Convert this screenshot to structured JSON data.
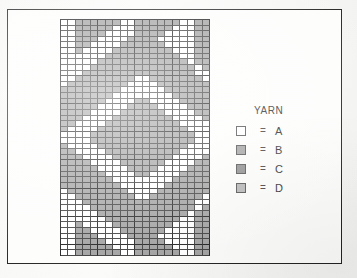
{
  "page": {
    "background_color": "#f7f7f5",
    "frame_color": "#232323"
  },
  "legend": {
    "title": "YARN",
    "entries": [
      {
        "equals": "=",
        "label": "A",
        "color": "#ffffff",
        "swatch_name": "yarn-swatch-a"
      },
      {
        "equals": "=",
        "label": "B",
        "color": "#9f9f9f",
        "swatch_name": "yarn-swatch-b"
      },
      {
        "equals": "=",
        "label": "C",
        "color": "#8a8a8a",
        "swatch_name": "yarn-swatch-c"
      },
      {
        "equals": "=",
        "label": "D",
        "color": "#b4b4b4",
        "swatch_name": "yarn-swatch-d"
      }
    ]
  },
  "chart_data": {
    "type": "heatmap",
    "title": "",
    "xlabel": "",
    "ylabel": "",
    "columns": 20,
    "rows": 42,
    "grid_on": true,
    "legend_position": "right",
    "major_rule_every": 5,
    "palette": {
      "A": "#ffffff",
      "B": "#9f9f9f",
      "C": "#8a8a8a",
      "D": "#b4b4b4"
    },
    "symbols": [
      "A",
      "B",
      "C",
      "D"
    ],
    "cells": [
      "AABBBBBBAABBBBBBAABB",
      "AABBBBBAAABBBBBAAABB",
      "AABBBBAAAABBBBAAAABB",
      "AABBBAAAABBBBAAAAABB",
      "AABBAAAABBBBBBAAAABB",
      "AABAAAABBBBBBBBAAABB",
      "AAAAAABBBBBBBBBBAABB",
      "AAAAABBBBBBBBBBBBABB",
      "AAAABBBBBBBBBBBBBBAB",
      "AAABBBBBBBBBBBBBBBAA",
      "AABBBBBBBBAABBBBBBBA",
      "ABBBBBBBBAAAABBBBBBB",
      "BBBBBBBBAAAAAABBBBBB",
      "BBBBBBBAAAAAAAABBBBB",
      "BBBBBBAAAABBAAAABBBB",
      "BBBBBAAAABBBBAAAABBB",
      "BBBBAAAABBBBBBAAAABB",
      "BBBAAAABBBBBBBBAAAAB",
      "BBAAAABBBBBBBBBBAAAA",
      "BAAAABBBBBBBBBBBBAAA",
      "AAAABBBBBBBBBBBBBBAA",
      "AAAABBBBBBBBBBBBBBAA",
      "BAAAABBBBBBBBBBBBAAA",
      "BBAAAABBBBBBBBBBAAAA",
      "BBBAAAABBBBBBBBAAAAB",
      "BBBBAAAABBBBBBAAAABB",
      "BBBBBAAAABBBBAAAABBB",
      "BBBBBBAAAABBAAAABBBB",
      "BBBBBBBAAAAAAAABBBBB",
      "BBBBBBBBAAAAAABBBBBB",
      "ABBBBBBBBAAAABBBBBBB",
      "AABBBBBBBBAABBBBBBBA",
      "AAABBBBBBBBBBBBBBBAA",
      "AAAABBBBBBBBBBBBBBAB",
      "AAAAABBBBBBBBBBBBABB",
      "AAAAAABBBBBBBBBBAABB",
      "AABAAAABBBBBBBBAAABB",
      "AABBAAAABBBBBBAAAABB",
      "AABBBAAAABBBBAAAAABB",
      "AABBBBAAAABBBBAAAABB",
      "AABBBBBAAABBBBBAAABB",
      "AABBBBBBAABBBBBBAABB"
    ]
  }
}
